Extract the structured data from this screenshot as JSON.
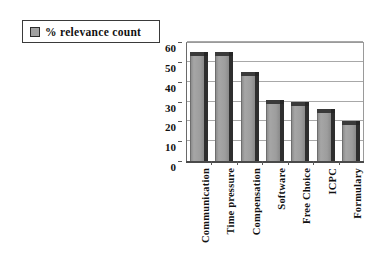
{
  "chart_data": {
    "type": "bar",
    "title": "",
    "subtitle": "",
    "xlabel": "",
    "ylabel": "",
    "categories": [
      "Communication",
      "Time pressure",
      "Compensation",
      "Software",
      "Free Choice",
      "ICPC",
      "Formulary"
    ],
    "series": [
      {
        "name": "% relevance count",
        "values": [
          55,
          55,
          45,
          31,
          30,
          26,
          20
        ]
      }
    ],
    "values": [
      55,
      55,
      45,
      31,
      30,
      26,
      20
    ],
    "ylim": [
      0,
      60
    ],
    "ytick_values": [
      0,
      10,
      20,
      30,
      40,
      50,
      60
    ],
    "ytick_labels": [
      "0",
      "10",
      "20",
      "30",
      "40",
      "50",
      "60"
    ],
    "grid": "horizontal",
    "legend_position": "top-left",
    "style": "3d-bar-grayscale",
    "colors": {
      "bar_face": "#9d9d9d",
      "bar_shadow": "#2e2e2e",
      "bar_top": "#3a3a3a",
      "gridline": "#a8a8a8",
      "axis": "#4a4a4a",
      "text": "#111111",
      "background": "#ffffff"
    }
  },
  "legend": {
    "label": "% relevance count",
    "swatch_name": "series-color-swatch"
  },
  "axes": {
    "y_ticks": [
      "60",
      "50",
      "40",
      "30",
      "20",
      "10",
      "0"
    ],
    "x_categories": [
      "Communication",
      "Time pressure",
      "Compensation",
      "Software",
      "Free Choice",
      "ICPC",
      "Formulary"
    ]
  }
}
